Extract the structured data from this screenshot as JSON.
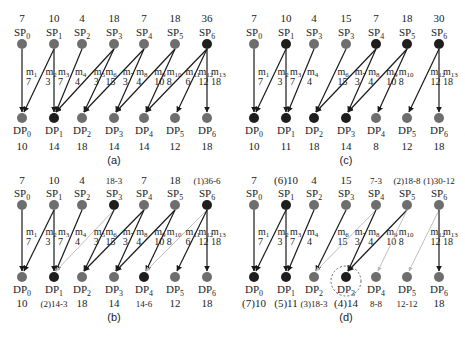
{
  "figure": {
    "colors": {
      "node_gray": "#6e6e6e",
      "node_dark": "#1e1e1e",
      "edge_dark": "#1a1a1a",
      "edge_light": "#b8b8b8",
      "text": "#222222",
      "text_light": "#7a7a7a",
      "circle_dashed": "#555555"
    },
    "panels": [
      {
        "id": "a",
        "caption": "(a)",
        "sp_values": [
          "7",
          "10",
          "4",
          "18",
          "7",
          "18",
          "36"
        ],
        "sp_value_light": [
          false,
          false,
          false,
          false,
          false,
          false,
          false
        ],
        "sp_labels": [
          "SP0",
          "SP1",
          "SP2",
          "SP3",
          "SP4",
          "SP5",
          "SP6"
        ],
        "sp_dark": [
          false,
          false,
          false,
          false,
          false,
          false,
          true
        ],
        "dp_labels": [
          "DP0",
          "DP1",
          "DP2",
          "DP3",
          "DP4",
          "DP5",
          "DP6"
        ],
        "dp_values": [
          "10",
          "14",
          "18",
          "14",
          "14",
          "12",
          "18"
        ],
        "dp_value_light": [
          false,
          false,
          false,
          false,
          false,
          false,
          false
        ],
        "dp_dark": [
          false,
          true,
          false,
          false,
          false,
          false,
          false
        ],
        "edges": [
          {
            "name": "m1",
            "from": 0,
            "to": 0,
            "w": "7",
            "style": "dark"
          },
          {
            "name": "m2",
            "from": 1,
            "to": 0,
            "w": "3",
            "style": "dark"
          },
          {
            "name": "m3",
            "from": 1,
            "to": 1,
            "w": "7",
            "style": "dark"
          },
          {
            "name": "m4",
            "from": 2,
            "to": 1,
            "w": "4",
            "style": "dark"
          },
          {
            "name": "m5",
            "from": 3,
            "to": 1,
            "w": "3",
            "style": "dark"
          },
          {
            "name": "m6",
            "from": 3,
            "to": 2,
            "w": "15",
            "style": "dark"
          },
          {
            "name": "m7",
            "from": 4,
            "to": 2,
            "w": "3",
            "style": "dark"
          },
          {
            "name": "m8",
            "from": 4,
            "to": 3,
            "w": "4",
            "style": "dark"
          },
          {
            "name": "m9",
            "from": 5,
            "to": 3,
            "w": "10",
            "style": "dark"
          },
          {
            "name": "m10",
            "from": 5,
            "to": 4,
            "w": "8",
            "style": "dark"
          },
          {
            "name": "m11",
            "from": 6,
            "to": 4,
            "w": "6",
            "style": "dark"
          },
          {
            "name": "m12",
            "from": 6,
            "to": 5,
            "w": "12",
            "style": "dark"
          },
          {
            "name": "m13",
            "from": 6,
            "to": 6,
            "w": "18",
            "style": "dark"
          }
        ]
      },
      {
        "id": "c",
        "caption": "(c)",
        "sp_values": [
          "7",
          "10",
          "4",
          "15",
          "7",
          "18",
          "30"
        ],
        "sp_value_light": [
          false,
          false,
          false,
          false,
          false,
          false,
          false
        ],
        "sp_labels": [
          "SP0",
          "SP1",
          "SP3",
          "SP3",
          "SP4",
          "SP5",
          "SP6"
        ],
        "sp_dark": [
          false,
          true,
          false,
          false,
          true,
          true,
          true
        ],
        "dp_labels": [
          "DP0",
          "DP1",
          "DP2",
          "DP3",
          "DP4",
          "DP5",
          "DP6"
        ],
        "dp_values": [
          "10",
          "11",
          "18",
          "14",
          "8",
          "12",
          "18"
        ],
        "dp_value_light": [
          false,
          false,
          false,
          false,
          false,
          false,
          false
        ],
        "dp_dark": [
          true,
          true,
          true,
          true,
          false,
          false,
          false
        ],
        "edges": [
          {
            "name": "m1",
            "from": 0,
            "to": 0,
            "w": "7",
            "style": "dark"
          },
          {
            "name": "m2",
            "from": 1,
            "to": 0,
            "w": "3",
            "style": "dark"
          },
          {
            "name": "m3",
            "from": 1,
            "to": 1,
            "w": "7",
            "style": "dark"
          },
          {
            "name": "m4",
            "from": 2,
            "to": 1,
            "w": "4",
            "style": "dark"
          },
          {
            "name": "m6",
            "from": 3,
            "to": 2,
            "w": "15",
            "style": "dark"
          },
          {
            "name": "m7",
            "from": 4,
            "to": 2,
            "w": "3",
            "style": "dark"
          },
          {
            "name": "m8",
            "from": 4,
            "to": 3,
            "w": "4",
            "style": "dark"
          },
          {
            "name": "m9",
            "from": 5,
            "to": 3,
            "w": "10",
            "style": "dark"
          },
          {
            "name": "m10",
            "from": 5,
            "to": 4,
            "w": "8",
            "style": "dark"
          },
          {
            "name": "m12",
            "from": 6,
            "to": 5,
            "w": "12",
            "style": "dark"
          },
          {
            "name": "m13",
            "from": 6,
            "to": 6,
            "w": "18",
            "style": "dark"
          }
        ]
      },
      {
        "id": "b",
        "caption": "(b)",
        "sp_values": [
          "7",
          "10",
          "4",
          "18-3",
          "7",
          "18",
          "(1)36-6"
        ],
        "sp_value_light": [
          false,
          false,
          false,
          true,
          false,
          false,
          true
        ],
        "sp_labels": [
          "SP0",
          "SP1",
          "SP2",
          "SP3",
          "SP4",
          "SP5",
          "SP6"
        ],
        "sp_dark": [
          false,
          false,
          false,
          true,
          false,
          false,
          true
        ],
        "dp_labels": [
          "DP0",
          "DP1",
          "DP2",
          "DP3",
          "DP4",
          "DP5",
          "DP6"
        ],
        "dp_values": [
          "10",
          "(2)14-3",
          "18",
          "14",
          "14-6",
          "12",
          "18"
        ],
        "dp_value_light": [
          false,
          true,
          false,
          false,
          true,
          false,
          false
        ],
        "dp_dark": [
          false,
          true,
          false,
          false,
          true,
          false,
          false
        ],
        "edges": [
          {
            "name": "m1",
            "from": 0,
            "to": 0,
            "w": "7",
            "style": "dark"
          },
          {
            "name": "m2",
            "from": 1,
            "to": 0,
            "w": "3",
            "style": "dark"
          },
          {
            "name": "m3",
            "from": 1,
            "to": 1,
            "w": "7",
            "style": "dark"
          },
          {
            "name": "m4",
            "from": 2,
            "to": 1,
            "w": "4",
            "style": "dark"
          },
          {
            "name": "m5",
            "from": 3,
            "to": 1,
            "w": "3",
            "style": "light"
          },
          {
            "name": "m6",
            "from": 3,
            "to": 2,
            "w": "15",
            "style": "dark"
          },
          {
            "name": "m7",
            "from": 4,
            "to": 2,
            "w": "3",
            "style": "dark"
          },
          {
            "name": "m8",
            "from": 4,
            "to": 3,
            "w": "4",
            "style": "dark"
          },
          {
            "name": "m9",
            "from": 5,
            "to": 3,
            "w": "10",
            "style": "dark"
          },
          {
            "name": "m10",
            "from": 5,
            "to": 4,
            "w": "8",
            "style": "dark"
          },
          {
            "name": "m11",
            "from": 6,
            "to": 4,
            "w": "6",
            "style": "light"
          },
          {
            "name": "m12",
            "from": 6,
            "to": 5,
            "w": "12",
            "style": "dark"
          },
          {
            "name": "m13",
            "from": 6,
            "to": 6,
            "w": "18",
            "style": "dark"
          }
        ]
      },
      {
        "id": "d",
        "caption": "(d)",
        "sp_values": [
          "7",
          "(6)10",
          "4",
          "15",
          "7-3",
          "(2)18-8",
          "(1)30-12"
        ],
        "sp_value_light": [
          false,
          false,
          false,
          false,
          true,
          true,
          true
        ],
        "sp_labels": [
          "SP0",
          "SP1",
          "SP2",
          "SP3",
          "SP4",
          "SP5",
          "SP6"
        ],
        "sp_dark": [
          false,
          true,
          false,
          false,
          false,
          false,
          false
        ],
        "dp_labels": [
          "DP0",
          "DP1",
          "DP2",
          "DP3",
          "DP4",
          "DP5",
          "DP6"
        ],
        "dp_values": [
          "(7)10",
          "(5)11",
          "(3)18-3",
          "(4)14",
          "8-8",
          "12-12",
          "18"
        ],
        "dp_value_light": [
          false,
          false,
          true,
          false,
          true,
          true,
          false
        ],
        "dp_dark": [
          true,
          true,
          false,
          true,
          false,
          false,
          false
        ],
        "highlight_dp": 3,
        "edges": [
          {
            "name": "m1",
            "from": 0,
            "to": 0,
            "w": "7",
            "style": "dark"
          },
          {
            "name": "m2",
            "from": 1,
            "to": 0,
            "w": "3",
            "style": "dark"
          },
          {
            "name": "m3",
            "from": 1,
            "to": 1,
            "w": "7",
            "style": "dark"
          },
          {
            "name": "m4",
            "from": 2,
            "to": 1,
            "w": "4",
            "style": "dark"
          },
          {
            "name": "m6",
            "from": 3,
            "to": 2,
            "w": "15",
            "style": "dark"
          },
          {
            "name": "m7",
            "from": 4,
            "to": 2,
            "w": "3",
            "style": "light"
          },
          {
            "name": "m8",
            "from": 4,
            "to": 3,
            "w": "4",
            "style": "dark"
          },
          {
            "name": "m9",
            "from": 5,
            "to": 3,
            "w": "10",
            "style": "dark"
          },
          {
            "name": "m10",
            "from": 5,
            "to": 4,
            "w": "8",
            "style": "light"
          },
          {
            "name": "m12",
            "from": 6,
            "to": 5,
            "w": "12",
            "style": "light"
          },
          {
            "name": "m13",
            "from": 6,
            "to": 6,
            "w": "18",
            "style": "dark"
          }
        ]
      }
    ]
  }
}
